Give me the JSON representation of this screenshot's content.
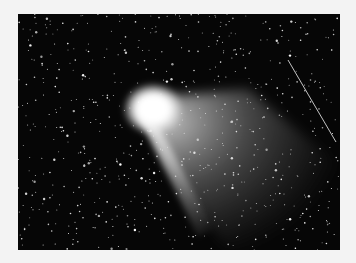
{
  "image": {
    "subject": "comet with diffuse tail against a dense starfield",
    "background_color": "#f3f3f3",
    "sky_color": "#060606",
    "photo_frame": {
      "x": 18,
      "y": 14,
      "width": 322,
      "height": 236
    },
    "comet": {
      "head_center": [
        135,
        97
      ],
      "head_radius": 26,
      "dust_fan_apex": [
        135,
        97
      ],
      "dust_fan_spread": [
        [
          225,
          80
        ],
        [
          320,
          180
        ],
        [
          200,
          235
        ]
      ],
      "ion_tail_end": [
        185,
        215
      ],
      "color": "#ffffff"
    },
    "streak": {
      "from": [
        270,
        46
      ],
      "to": [
        318,
        128
      ],
      "color": "#d8d8d8"
    },
    "star_count": 700,
    "star_seed": 7
  }
}
